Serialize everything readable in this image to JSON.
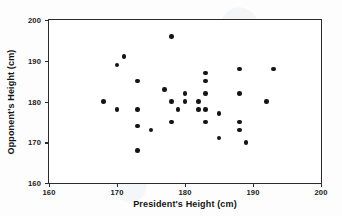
{
  "chart_data": {
    "type": "scatter",
    "title": "",
    "xlabel": "President's Height (cm)",
    "ylabel": "Opponent's Height (cm)",
    "xlim": [
      160,
      200
    ],
    "ylim": [
      160,
      200
    ],
    "xticks": [
      160,
      170,
      180,
      190,
      200
    ],
    "yticks": [
      160,
      170,
      180,
      190,
      200
    ],
    "grid": false,
    "legend": null,
    "marker": "filled-circle",
    "marker_color": "#141414",
    "points": [
      {
        "x": 168,
        "y": 180
      },
      {
        "x": 170,
        "y": 189
      },
      {
        "x": 170,
        "y": 178
      },
      {
        "x": 171,
        "y": 191
      },
      {
        "x": 173,
        "y": 185
      },
      {
        "x": 173,
        "y": 178
      },
      {
        "x": 173,
        "y": 174
      },
      {
        "x": 173,
        "y": 168
      },
      {
        "x": 175,
        "y": 173
      },
      {
        "x": 177,
        "y": 183
      },
      {
        "x": 178,
        "y": 196
      },
      {
        "x": 178,
        "y": 180
      },
      {
        "x": 178,
        "y": 175
      },
      {
        "x": 179,
        "y": 178
      },
      {
        "x": 180,
        "y": 182
      },
      {
        "x": 180,
        "y": 180
      },
      {
        "x": 182,
        "y": 180
      },
      {
        "x": 182,
        "y": 178
      },
      {
        "x": 183,
        "y": 187
      },
      {
        "x": 183,
        "y": 185
      },
      {
        "x": 183,
        "y": 182
      },
      {
        "x": 183,
        "y": 178
      },
      {
        "x": 183,
        "y": 175
      },
      {
        "x": 185,
        "y": 177
      },
      {
        "x": 185,
        "y": 171
      },
      {
        "x": 188,
        "y": 188
      },
      {
        "x": 188,
        "y": 182
      },
      {
        "x": 188,
        "y": 175
      },
      {
        "x": 188,
        "y": 173
      },
      {
        "x": 189,
        "y": 170
      },
      {
        "x": 192,
        "y": 180
      },
      {
        "x": 193,
        "y": 188
      }
    ]
  },
  "axes": {
    "x_tick_labels": [
      "160",
      "170",
      "180",
      "190",
      "200"
    ],
    "y_tick_labels": [
      "160",
      "170",
      "180",
      "190",
      "200"
    ],
    "x_title": "President's Height (cm)",
    "y_title": "Opponent's Height (cm)"
  }
}
